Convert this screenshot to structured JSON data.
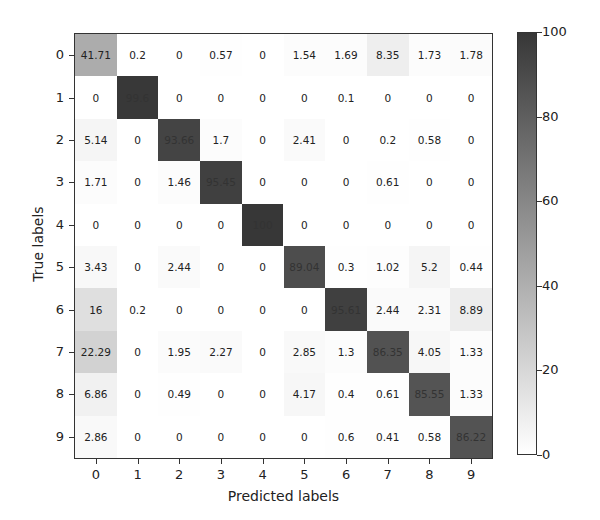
{
  "chart_data": {
    "type": "heatmap",
    "title": "",
    "xlabel": "Predicted labels",
    "ylabel": "True labels",
    "x_ticks": [
      "0",
      "1",
      "2",
      "3",
      "4",
      "5",
      "6",
      "7",
      "8",
      "9"
    ],
    "y_ticks": [
      "0",
      "1",
      "2",
      "3",
      "4",
      "5",
      "6",
      "7",
      "8",
      "9"
    ],
    "colormap": "Greys",
    "vmin": 0,
    "vmax": 100,
    "colorbar_ticks": [
      "0",
      "20",
      "40",
      "60",
      "80",
      "100"
    ],
    "matrix": [
      [
        41.71,
        0.2,
        0.0,
        0.57,
        0.0,
        1.54,
        1.69,
        8.35,
        1.73,
        1.78
      ],
      [
        0.0,
        99.6,
        0.0,
        0.0,
        0.0,
        0.0,
        0.1,
        0.0,
        0.0,
        0.0
      ],
      [
        5.14,
        0.0,
        93.66,
        1.7,
        0.0,
        2.41,
        0.0,
        0.2,
        0.58,
        0.0
      ],
      [
        1.71,
        0.0,
        1.46,
        95.45,
        0.0,
        0.0,
        0.0,
        0.61,
        0.0,
        0.0
      ],
      [
        0.0,
        0.0,
        0.0,
        0.0,
        100.0,
        0.0,
        0.0,
        0.0,
        0.0,
        0.0
      ],
      [
        3.43,
        0.0,
        2.44,
        0.0,
        0.0,
        89.04,
        0.3,
        1.02,
        5.2,
        0.44
      ],
      [
        16.0,
        0.2,
        0.0,
        0.0,
        0.0,
        0.0,
        95.61,
        2.44,
        2.31,
        8.89
      ],
      [
        22.29,
        0.0,
        1.95,
        2.27,
        0.0,
        2.85,
        1.3,
        86.35,
        4.05,
        1.33
      ],
      [
        6.86,
        0.0,
        0.49,
        0.0,
        0.0,
        4.17,
        0.4,
        0.61,
        85.55,
        1.33
      ],
      [
        2.86,
        0.0,
        0.0,
        0.0,
        0.0,
        0.0,
        0.6,
        0.41,
        0.58,
        86.22
      ]
    ]
  }
}
